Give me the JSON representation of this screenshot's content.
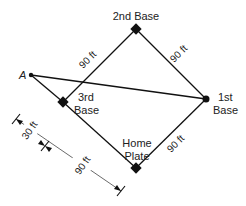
{
  "diagram": {
    "colors": {
      "line": "#111111",
      "thin_line": "#444444",
      "text": "#222222",
      "background": "#ffffff"
    },
    "bases": {
      "second": {
        "label": "2nd Base"
      },
      "first": {
        "label_line1": "1st",
        "label_line2": "Base"
      },
      "third": {
        "label_line1": "3rd",
        "label_line2": "Base"
      },
      "home": {
        "label_line1": "Home",
        "label_line2": "Plate"
      }
    },
    "point_a": {
      "label": "A"
    },
    "side_lengths": {
      "third_to_second": "90 ft",
      "second_to_first": "90 ft",
      "home_to_first": "90 ft"
    },
    "dimensions": {
      "a_to_third_extension": "30 ft",
      "third_to_home": "90 ft"
    }
  }
}
